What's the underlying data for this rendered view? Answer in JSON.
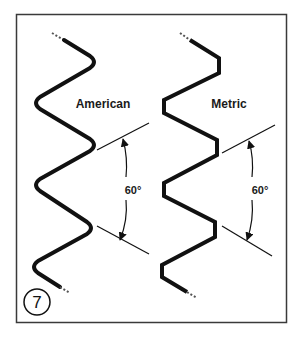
{
  "figure": {
    "number": "7",
    "frame_color": "#3a3a3a",
    "ink_color": "#111111"
  },
  "panels": [
    {
      "id": "american",
      "title": "American",
      "profile": "rounded crests and roots",
      "angle_label": "60°"
    },
    {
      "id": "metric",
      "title": "Metric",
      "profile": "flat crests and roots",
      "angle_label": "60°"
    }
  ]
}
